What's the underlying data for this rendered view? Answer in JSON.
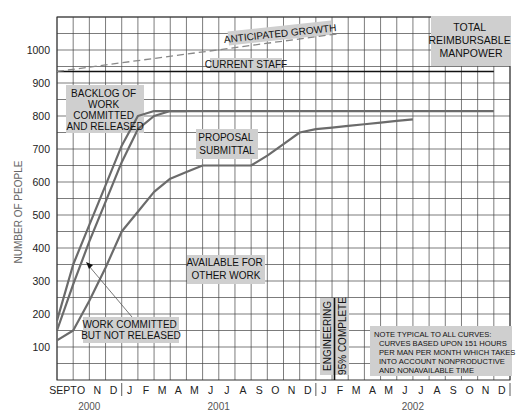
{
  "chart_data": {
    "type": "line",
    "title": "Total Reimbursable Manpower",
    "xlabel": "",
    "ylabel": "NUMBER OF PEOPLE",
    "ylim": [
      0,
      1100
    ],
    "y_ticks": [
      100,
      200,
      300,
      400,
      500,
      600,
      700,
      800,
      900,
      1000
    ],
    "x_ticks": [
      "SEPT",
      "O",
      "N",
      "D",
      "J",
      "F",
      "M",
      "A",
      "M",
      "J",
      "J",
      "A",
      "S",
      "O",
      "N",
      "D",
      "J",
      "F",
      "M",
      "A",
      "M",
      "J",
      "J",
      "A",
      "S",
      "O",
      "N",
      "D"
    ],
    "year_labels": [
      {
        "label": "2000",
        "at": 1.5
      },
      {
        "label": "2001",
        "at": 9.5
      },
      {
        "label": "2002",
        "at": 21.5
      }
    ],
    "grid": true,
    "series": [
      {
        "name": "Backlog of work committed and released (upper)",
        "x": [
          0,
          1,
          2,
          3,
          4,
          5,
          6,
          7,
          8,
          27
        ],
        "values": [
          180,
          350,
          470,
          590,
          710,
          800,
          815,
          815,
          815,
          815
        ]
      },
      {
        "name": "Backlog of work committed and released (lower)",
        "x": [
          0,
          1,
          2,
          3,
          4,
          5,
          6,
          7,
          8
        ],
        "values": [
          150,
          290,
          420,
          540,
          660,
          760,
          800,
          815,
          815
        ]
      },
      {
        "name": "Proposal submittal",
        "x": [
          0,
          1,
          2,
          3,
          4,
          5,
          6,
          7,
          8,
          9,
          10,
          11,
          12,
          13,
          14,
          15,
          16,
          17,
          18,
          19,
          20,
          21,
          22
        ],
        "values": [
          120,
          150,
          240,
          340,
          450,
          510,
          570,
          610,
          630,
          650,
          650,
          650,
          650,
          680,
          715,
          750,
          760,
          765,
          770,
          775,
          780,
          785,
          790
        ]
      },
      {
        "name": "Current staff",
        "x": [
          0,
          27
        ],
        "values": [
          935,
          935
        ]
      },
      {
        "name": "Anticipated growth",
        "x": [
          0,
          17.5
        ],
        "values": [
          935,
          1050
        ],
        "style": "dashed"
      }
    ],
    "annotations": [
      "ANTICIPATED GROWTH",
      "CURRENT STAFF",
      "TOTAL REIMBURSABLE MANPOWER",
      "BACKLOG OF WORK COMMITTED AND RELEASED",
      "PROPOSAL SUBMITTAL",
      "AVAILABLE FOR OTHER WORK",
      "WORK COMMITTED BUT NOT RELEASED",
      "ENGINEERING 95% COMPLETE",
      "NOTE TYPICAL TO ALL CURVES: CURVES BASED UPON 151 HOURS PER MAN PER MONTH WHICH TAKES INTO ACCOUNT NONPRODUCTIVE AND NONAVAILABLE TIME"
    ]
  },
  "labels": {
    "ylabel": "NUMBER OF PEOPLE",
    "growth": "ANTICIPATED GROWTH",
    "staff": "CURRENT STAFF",
    "total1": "TOTAL",
    "total2": "REIMBURSABLE",
    "total3": "MANPOWER",
    "backlog1": "BACKLOG OF",
    "backlog2": "WORK",
    "backlog3": "COMMITTED",
    "backlog4": "AND RELEASED",
    "proposal1": "PROPOSAL",
    "proposal2": "SUBMITTAL",
    "avail1": "AVAILABLE FOR",
    "avail2": "OTHER WORK",
    "wcnr1": "WORK COMMITTED",
    "wcnr2": "BUT NOT RELEASED",
    "eng1": "ENGINEERING",
    "eng2": "95% COMPLETE",
    "note1": "NOTE TYPICAL TO ALL CURVES:",
    "note2": "CURVES BASED UPON 151 HOURS",
    "note3": "PER MAN PER MONTH WHICH TAKES",
    "note4": "INTO ACCOUNT NONPRODUCTIVE",
    "note5": "AND NONAVAILABLE TIME"
  },
  "colors": {
    "curve": "#6b6b6b",
    "grid": "#333333",
    "label_bg": "#cfcfcf"
  }
}
